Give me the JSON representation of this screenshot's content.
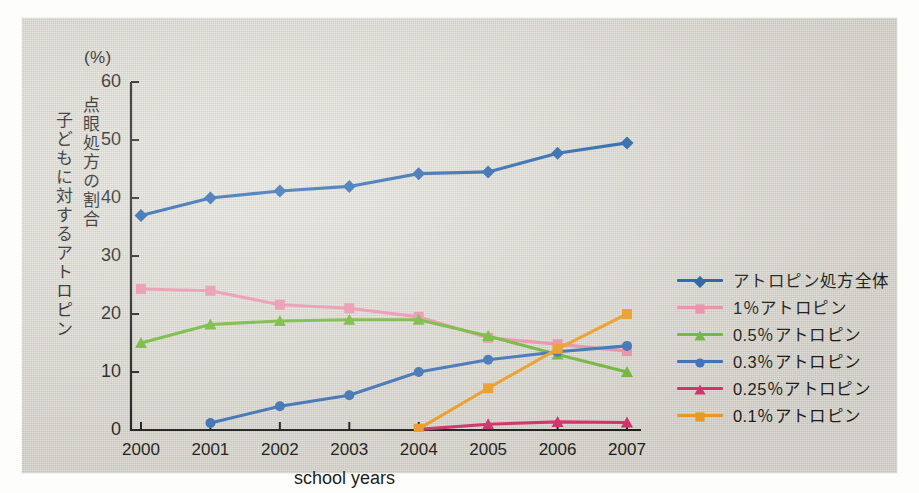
{
  "unit_label": "(%)",
  "axis_captions": {
    "vertical_outer": "子どもに対するアトロピン",
    "vertical_inner": "点眼処方の割合",
    "x_title": "school years"
  },
  "colors": {
    "paper": "#dedbd0",
    "ink": "#1d1d1b",
    "total": "#1f5fa9",
    "p1": "#ef94ad",
    "p05": "#72bb3a",
    "p03": "#3d73b8",
    "p025": "#d8316b",
    "p01": "#f3a025"
  },
  "legend": {
    "items": [
      {
        "label": "アトロピン処方全体",
        "color": "#1f5fa9",
        "marker": "diamond"
      },
      {
        "label": "1％アトロピン",
        "color": "#ef94ad",
        "marker": "square"
      },
      {
        "label": "0.5％アトロピン",
        "color": "#72bb3a",
        "marker": "triangle"
      },
      {
        "label": "0.3％アトロピン",
        "color": "#3d73b8",
        "marker": "circle"
      },
      {
        "label": "0.25％アトロピン",
        "color": "#d8316b",
        "marker": "triangle"
      },
      {
        "label": "0.1％アトロピン",
        "color": "#f3a025",
        "marker": "square"
      }
    ]
  },
  "chart_data": {
    "type": "line",
    "title": "",
    "xlabel": "school years",
    "ylabel": "子どもに対するアトロピン点眼処方の割合",
    "yunit": "(%)",
    "categories": [
      "2000",
      "2001",
      "2002",
      "2003",
      "2004",
      "2005",
      "2006",
      "2007"
    ],
    "xticklabels": [
      "2000",
      "2001",
      "2002",
      "2003",
      "2004",
      "2005",
      "2006",
      "2007"
    ],
    "yticks": [
      0,
      10,
      20,
      30,
      40,
      50,
      60
    ],
    "ylim": [
      0,
      60
    ],
    "grid": false,
    "legend_position": "right",
    "series": [
      {
        "name": "アトロピン処方全体",
        "color": "#1f5fa9",
        "marker": "diamond",
        "values": [
          37.0,
          40.0,
          41.2,
          42.0,
          44.2,
          44.5,
          47.7,
          49.5
        ]
      },
      {
        "name": "1％アトロピン",
        "color": "#ef94ad",
        "marker": "square",
        "values": [
          24.3,
          24.0,
          21.6,
          21.0,
          19.5,
          15.9,
          14.8,
          13.6
        ]
      },
      {
        "name": "0.5％アトロピン",
        "color": "#72bb3a",
        "marker": "triangle",
        "values": [
          15.0,
          18.2,
          18.8,
          19.0,
          19.0,
          16.2,
          13.0,
          10.0
        ]
      },
      {
        "name": "0.3％アトロピン",
        "color": "#3d73b8",
        "marker": "circle",
        "values": [
          null,
          1.2,
          4.1,
          6.0,
          10.0,
          12.1,
          13.5,
          14.5
        ]
      },
      {
        "name": "0.25％アトロピン",
        "color": "#d8316b",
        "marker": "triangle",
        "values": [
          null,
          null,
          null,
          null,
          0.1,
          1.0,
          1.4,
          1.3
        ]
      },
      {
        "name": "0.1％アトロピン",
        "color": "#f3a025",
        "marker": "square",
        "values": [
          null,
          null,
          null,
          null,
          0.2,
          7.2,
          14.0,
          20.0
        ]
      }
    ]
  }
}
